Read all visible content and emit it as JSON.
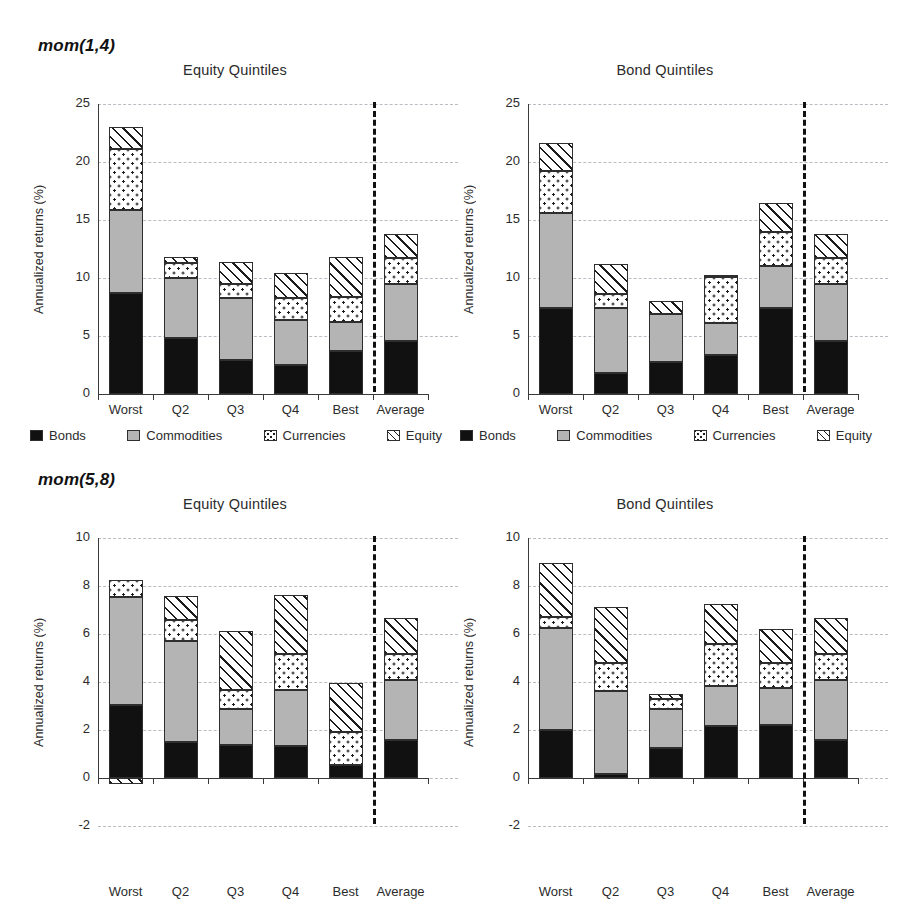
{
  "figure": {
    "panels": [
      {
        "label": "mom(1,4)"
      },
      {
        "label": "mom(5,8)"
      }
    ],
    "legend": [
      {
        "key": "bonds",
        "label": "Bonds"
      },
      {
        "key": "commodities",
        "label": "Commodities"
      },
      {
        "key": "currencies",
        "label": "Currencies"
      },
      {
        "key": "equity",
        "label": "Equity"
      }
    ],
    "colors": {
      "bonds": "#111111",
      "commodities": "#b4b4b4",
      "currencies": "#ffffff",
      "equity": "#ffffff",
      "grid": "#b9bcc2",
      "axis": "#3a3a3a",
      "divider": "#111111"
    }
  },
  "chart_data": [
    {
      "id": "mom14-equity",
      "type": "bar",
      "stacked": true,
      "panel": "mom(1,4)",
      "title": "Equity Quintiles",
      "xlabel": "",
      "ylabel": "Annualized returns (%)",
      "ylim": [
        0,
        25
      ],
      "yticks": [
        0,
        5,
        10,
        15,
        20,
        25
      ],
      "grid": true,
      "legend_position": "bottom",
      "divider_after": "Best",
      "categories": [
        "Worst",
        "Q2",
        "Q3",
        "Q4",
        "Best",
        "Average"
      ],
      "series": [
        {
          "name": "Bonds",
          "values": [
            8.7,
            4.8,
            2.9,
            2.5,
            3.7,
            4.6
          ]
        },
        {
          "name": "Commodities",
          "values": [
            7.2,
            5.2,
            5.4,
            3.9,
            2.5,
            4.9
          ]
        },
        {
          "name": "Currencies",
          "values": [
            5.2,
            1.3,
            1.2,
            1.9,
            2.2,
            2.2
          ]
        },
        {
          "name": "Equity",
          "values": [
            1.9,
            0.5,
            1.9,
            2.1,
            3.4,
            2.1
          ]
        }
      ],
      "totals": [
        23.0,
        11.8,
        11.4,
        10.4,
        11.8,
        13.8
      ]
    },
    {
      "id": "mom14-bond",
      "type": "bar",
      "stacked": true,
      "panel": "mom(1,4)",
      "title": "Bond Quintiles",
      "xlabel": "",
      "ylabel": "Annualized returns (%)",
      "ylim": [
        0,
        25
      ],
      "yticks": [
        0,
        5,
        10,
        15,
        20,
        25
      ],
      "grid": true,
      "legend_position": "bottom",
      "divider_after": "Best",
      "categories": [
        "Worst",
        "Q2",
        "Q3",
        "Q4",
        "Best",
        "Average"
      ],
      "series": [
        {
          "name": "Bonds",
          "values": [
            7.4,
            1.8,
            2.8,
            3.4,
            7.4,
            4.6
          ]
        },
        {
          "name": "Commodities",
          "values": [
            8.2,
            5.6,
            4.1,
            2.7,
            3.6,
            4.9
          ]
        },
        {
          "name": "Currencies",
          "values": [
            3.6,
            1.2,
            0.0,
            4.0,
            3.0,
            2.2
          ]
        },
        {
          "name": "Equity",
          "values": [
            2.4,
            2.6,
            1.1,
            0.2,
            2.5,
            2.1
          ]
        }
      ],
      "totals": [
        21.6,
        11.2,
        8.0,
        10.3,
        16.5,
        13.8
      ]
    },
    {
      "id": "mom58-equity",
      "type": "bar",
      "stacked": true,
      "panel": "mom(5,8)",
      "title": "Equity Quintiles",
      "xlabel": "",
      "ylabel": "Annualized returns (%)",
      "ylim": [
        -2,
        10
      ],
      "yticks": [
        -2,
        0,
        2,
        4,
        6,
        8,
        10
      ],
      "grid": true,
      "legend_position": "bottom",
      "divider_after": "Best",
      "categories": [
        "Worst",
        "Q2",
        "Q3",
        "Q4",
        "Best",
        "Average"
      ],
      "series": [
        {
          "name": "Bonds",
          "values": [
            3.05,
            1.5,
            1.38,
            1.35,
            0.55,
            1.58
          ]
        },
        {
          "name": "Commodities",
          "values": [
            4.48,
            4.22,
            1.5,
            2.32,
            0.0,
            2.52
          ]
        },
        {
          "name": "Currencies",
          "values": [
            0.7,
            0.85,
            0.8,
            1.5,
            1.35,
            1.05
          ]
        },
        {
          "name": "Equity",
          "values": [
            -0.25,
            1.0,
            2.45,
            2.45,
            2.05,
            1.5
          ]
        }
      ],
      "totals": [
        8.23,
        7.57,
        6.13,
        7.62,
        3.95,
        6.65
      ]
    },
    {
      "id": "mom58-bond",
      "type": "bar",
      "stacked": true,
      "panel": "mom(5,8)",
      "title": "Bond Quintiles",
      "xlabel": "",
      "ylabel": "Annualized returns (%)",
      "ylim": [
        -2,
        10
      ],
      "yticks": [
        -2,
        0,
        2,
        4,
        6,
        8,
        10
      ],
      "grid": true,
      "legend_position": "bottom",
      "divider_after": "Best",
      "categories": [
        "Worst",
        "Q2",
        "Q3",
        "Q4",
        "Best",
        "Average"
      ],
      "series": [
        {
          "name": "Bonds",
          "values": [
            2.02,
            0.15,
            1.25,
            2.15,
            2.2,
            1.58
          ]
        },
        {
          "name": "Commodities",
          "values": [
            4.22,
            3.48,
            1.62,
            1.68,
            1.55,
            2.52
          ]
        },
        {
          "name": "Currencies",
          "values": [
            0.45,
            1.18,
            0.42,
            1.75,
            1.05,
            1.05
          ]
        },
        {
          "name": "Equity",
          "values": [
            2.28,
            2.32,
            0.22,
            1.65,
            1.42,
            1.5
          ]
        }
      ],
      "totals": [
        8.97,
        7.13,
        3.51,
        7.23,
        6.22,
        6.65
      ]
    }
  ]
}
